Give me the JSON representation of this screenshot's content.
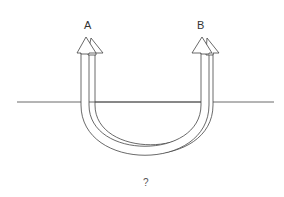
{
  "diagram": {
    "labels": {
      "a": "A",
      "b": "B",
      "question": "?"
    },
    "colors": {
      "stroke": "#444444",
      "background": "#ffffff"
    }
  }
}
